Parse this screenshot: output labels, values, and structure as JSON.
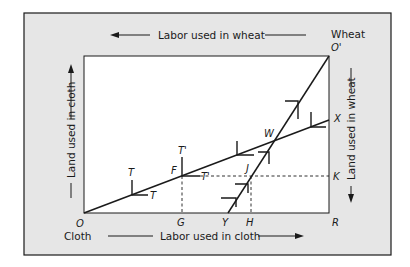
{
  "corners": {
    "cloth_label": "Cloth",
    "wheat_label": "Wheat",
    "cloth_origin": "O",
    "wheat_origin": "O'"
  },
  "axes": {
    "top": "Labor used in wheat",
    "bottom": "Labor used in cloth",
    "left": "Land used in cloth",
    "right": "Land used in wheat"
  },
  "points": {
    "T1": "T",
    "T2": "T",
    "T3": "T'",
    "T4": "T'",
    "F": "F",
    "J": "J",
    "W": "W",
    "X": "X",
    "K": "K",
    "G": "G",
    "Y": "Y",
    "H": "H",
    "R": "R"
  },
  "colors": {
    "frame_fill": "#e6e6e6",
    "box_fill": "#ffffff",
    "stroke": "#1a1a1a"
  }
}
